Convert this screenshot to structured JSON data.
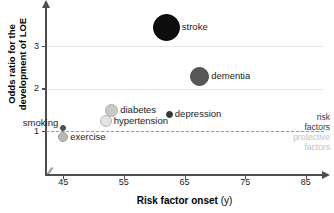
{
  "chart_data": {
    "type": "scatter",
    "title": "",
    "xlabel": "Risk factor onset",
    "xlabel_unit": "(y)",
    "ylabel": "Odds ratio for the\ndevelopment of LOE",
    "xlim": [
      42,
      88
    ],
    "ylim": [
      0,
      3.95
    ],
    "xticks": [
      45,
      55,
      65,
      75,
      85
    ],
    "yticks": [
      1,
      2,
      3
    ],
    "grid": "horizontal-at-yticks",
    "legend": "none",
    "axis_break_x": true,
    "threshold_line": {
      "value": 1,
      "style": "dashed",
      "color": "#9a9a9a",
      "above_label": "risk\nfactors",
      "below_label": "protective\nfactors"
    },
    "points": [
      {
        "name": "stroke",
        "x": 62.0,
        "y": 3.45,
        "radius_px": 13.5,
        "color": "#0d0d0d",
        "border": "#000000",
        "label_side": "right"
      },
      {
        "name": "dementia",
        "x": 67.5,
        "y": 2.3,
        "radius_px": 9.5,
        "color": "#575757",
        "border": "#4a4a4a",
        "label_side": "right"
      },
      {
        "name": "diabetes",
        "x": 53.0,
        "y": 1.5,
        "radius_px": 6.5,
        "color": "#c9c9c9",
        "border": "#b0b0b0",
        "label_side": "right"
      },
      {
        "name": "hypertension",
        "x": 52.0,
        "y": 1.24,
        "radius_px": 6.0,
        "color": "#e4e4e4",
        "border": "#b5b5b5",
        "label_side": "right"
      },
      {
        "name": "depression",
        "x": 62.5,
        "y": 1.4,
        "radius_px": 3.5,
        "color": "#3a3a3a",
        "border": "#2e2e2e",
        "label_side": "right"
      },
      {
        "name": "smoking",
        "x": 45.0,
        "y": 1.08,
        "radius_px": 3.0,
        "color": "#555555",
        "border": "#444444",
        "label_side": "left"
      },
      {
        "name": "exercise",
        "x": 45.0,
        "y": 0.88,
        "radius_px": 5.0,
        "color": "#b9b9b9",
        "border": "#9a9a9a",
        "label_side": "right"
      }
    ]
  },
  "axis": {
    "y_title": "Odds ratio for the\ndevelopment of LOE",
    "x_title": "Risk factor onset",
    "x_title_unit": "(y)",
    "break_symbol": "//"
  },
  "annotations": {
    "risk_factors": "risk\nfactors",
    "protective_factors": "protective\nfactors"
  }
}
